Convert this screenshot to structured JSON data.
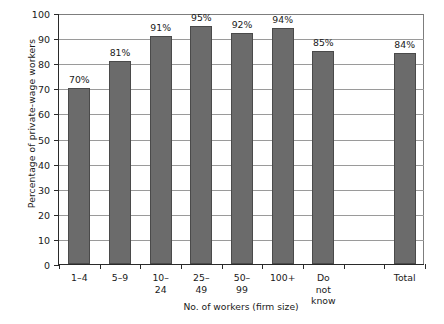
{
  "chart_data": {
    "type": "bar",
    "title": "",
    "xlabel": "No. of workers (firm size)",
    "ylabel": "Percentage of private-wage workers",
    "categories": [
      "1–4",
      "5–9",
      "10–24",
      "25–49",
      "50–99",
      "100+",
      "Do not\nknow",
      "",
      "Total"
    ],
    "values": [
      70,
      81,
      91,
      95,
      92,
      94,
      85,
      null,
      84
    ],
    "data_labels": [
      "70%",
      "81%",
      "91%",
      "95%",
      "92%",
      "94%",
      "85%",
      "",
      "84%"
    ],
    "ylim": [
      0,
      100
    ],
    "ytick_step": 10,
    "ytick_labels": [
      "0",
      "10",
      "20",
      "30",
      "40",
      "50",
      "60",
      "70",
      "80",
      "90",
      "100"
    ],
    "grid": true,
    "legend": "none",
    "bar_color": "#6b6b6b",
    "bar_edge_color": "#4a4a4a",
    "gridline_color": "#9a9a9a",
    "axis_color": "#2a2a2a",
    "background_color": "#ffffff"
  }
}
